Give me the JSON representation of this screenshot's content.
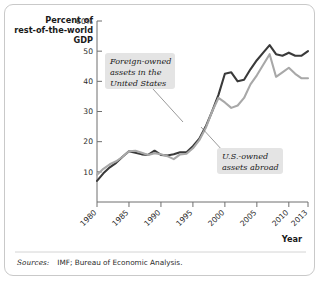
{
  "figure": {
    "y_axis_title_lines": [
      "Percent of",
      "rest-of-the-world",
      "GDP"
    ],
    "x_axis_title": "Year",
    "source_label": "Sources:",
    "source_text": "IMF; Bureau of Economic Analysis.",
    "colors": {
      "foreign_owned_line": "#3a3a3a",
      "us_owned_line": "#a8a8a8",
      "axis": "#6f6f6f",
      "border": "#c9c9c9",
      "annotation_background": "#e4e4e4",
      "leader_line": "#6f6f6f"
    }
  },
  "chart_data": {
    "type": "line",
    "title": "",
    "subtitle": "",
    "xlabel": "Year",
    "ylabel": "Percent of rest-of-the-world GDP",
    "xlim": [
      1980,
      2013
    ],
    "ylim": [
      0,
      60
    ],
    "grid": false,
    "legend_position": "inline-annotations",
    "x_tick_labels": [
      "1980",
      "1985",
      "1990",
      "1995",
      "2000",
      "2005",
      "2010",
      "2013"
    ],
    "x_ticks": [
      1980,
      1985,
      1990,
      1995,
      2000,
      2005,
      2010,
      2013
    ],
    "y_tick_labels": [
      "10",
      "20",
      "30",
      "40",
      "50",
      "60%"
    ],
    "y_ticks": [
      10,
      20,
      30,
      40,
      50,
      60
    ],
    "x": [
      1980,
      1981,
      1982,
      1983,
      1984,
      1985,
      1986,
      1987,
      1988,
      1989,
      1990,
      1991,
      1992,
      1993,
      1994,
      1995,
      1996,
      1997,
      1998,
      1999,
      2000,
      2001,
      2002,
      2003,
      2004,
      2005,
      2006,
      2007,
      2008,
      2009,
      2010,
      2011,
      2012,
      2013
    ],
    "series": [
      {
        "name": "Foreign-owned assets in the United States",
        "color": "#3a3a3a",
        "values": [
          7,
          9.5,
          11.5,
          13,
          15,
          16.8,
          16.3,
          15.8,
          15.6,
          17,
          15.6,
          15.4,
          15.8,
          16.5,
          16.5,
          18.5,
          21,
          25,
          30,
          35.5,
          42.5,
          43,
          40,
          40.5,
          44,
          47,
          49.5,
          52,
          49,
          48.5,
          49.5,
          48.5,
          48.5,
          50
        ]
      },
      {
        "name": "U.S.-owned assets abroad",
        "color": "#a8a8a8",
        "values": [
          9,
          11,
          12.5,
          13.5,
          15,
          16.8,
          17,
          16.3,
          15.6,
          16.2,
          15.8,
          15.2,
          14.2,
          15.8,
          16,
          17.8,
          20.5,
          24.5,
          30,
          34.5,
          33,
          31.2,
          32,
          34.5,
          39,
          42,
          45.5,
          49,
          41.5,
          43,
          44.5,
          42.5,
          41,
          41
        ]
      }
    ],
    "annotations": [
      {
        "name": "foreign-owned-label",
        "lines": [
          "Foreign-owned",
          "assets in the",
          "United States"
        ],
        "target_series": "Foreign-owned assets in the United States",
        "target_x": 1997
      },
      {
        "name": "us-owned-label",
        "lines": [
          "U.S.-owned",
          "assets abroad"
        ],
        "target_series": "U.S.-owned assets abroad",
        "target_x": 2001
      }
    ]
  }
}
